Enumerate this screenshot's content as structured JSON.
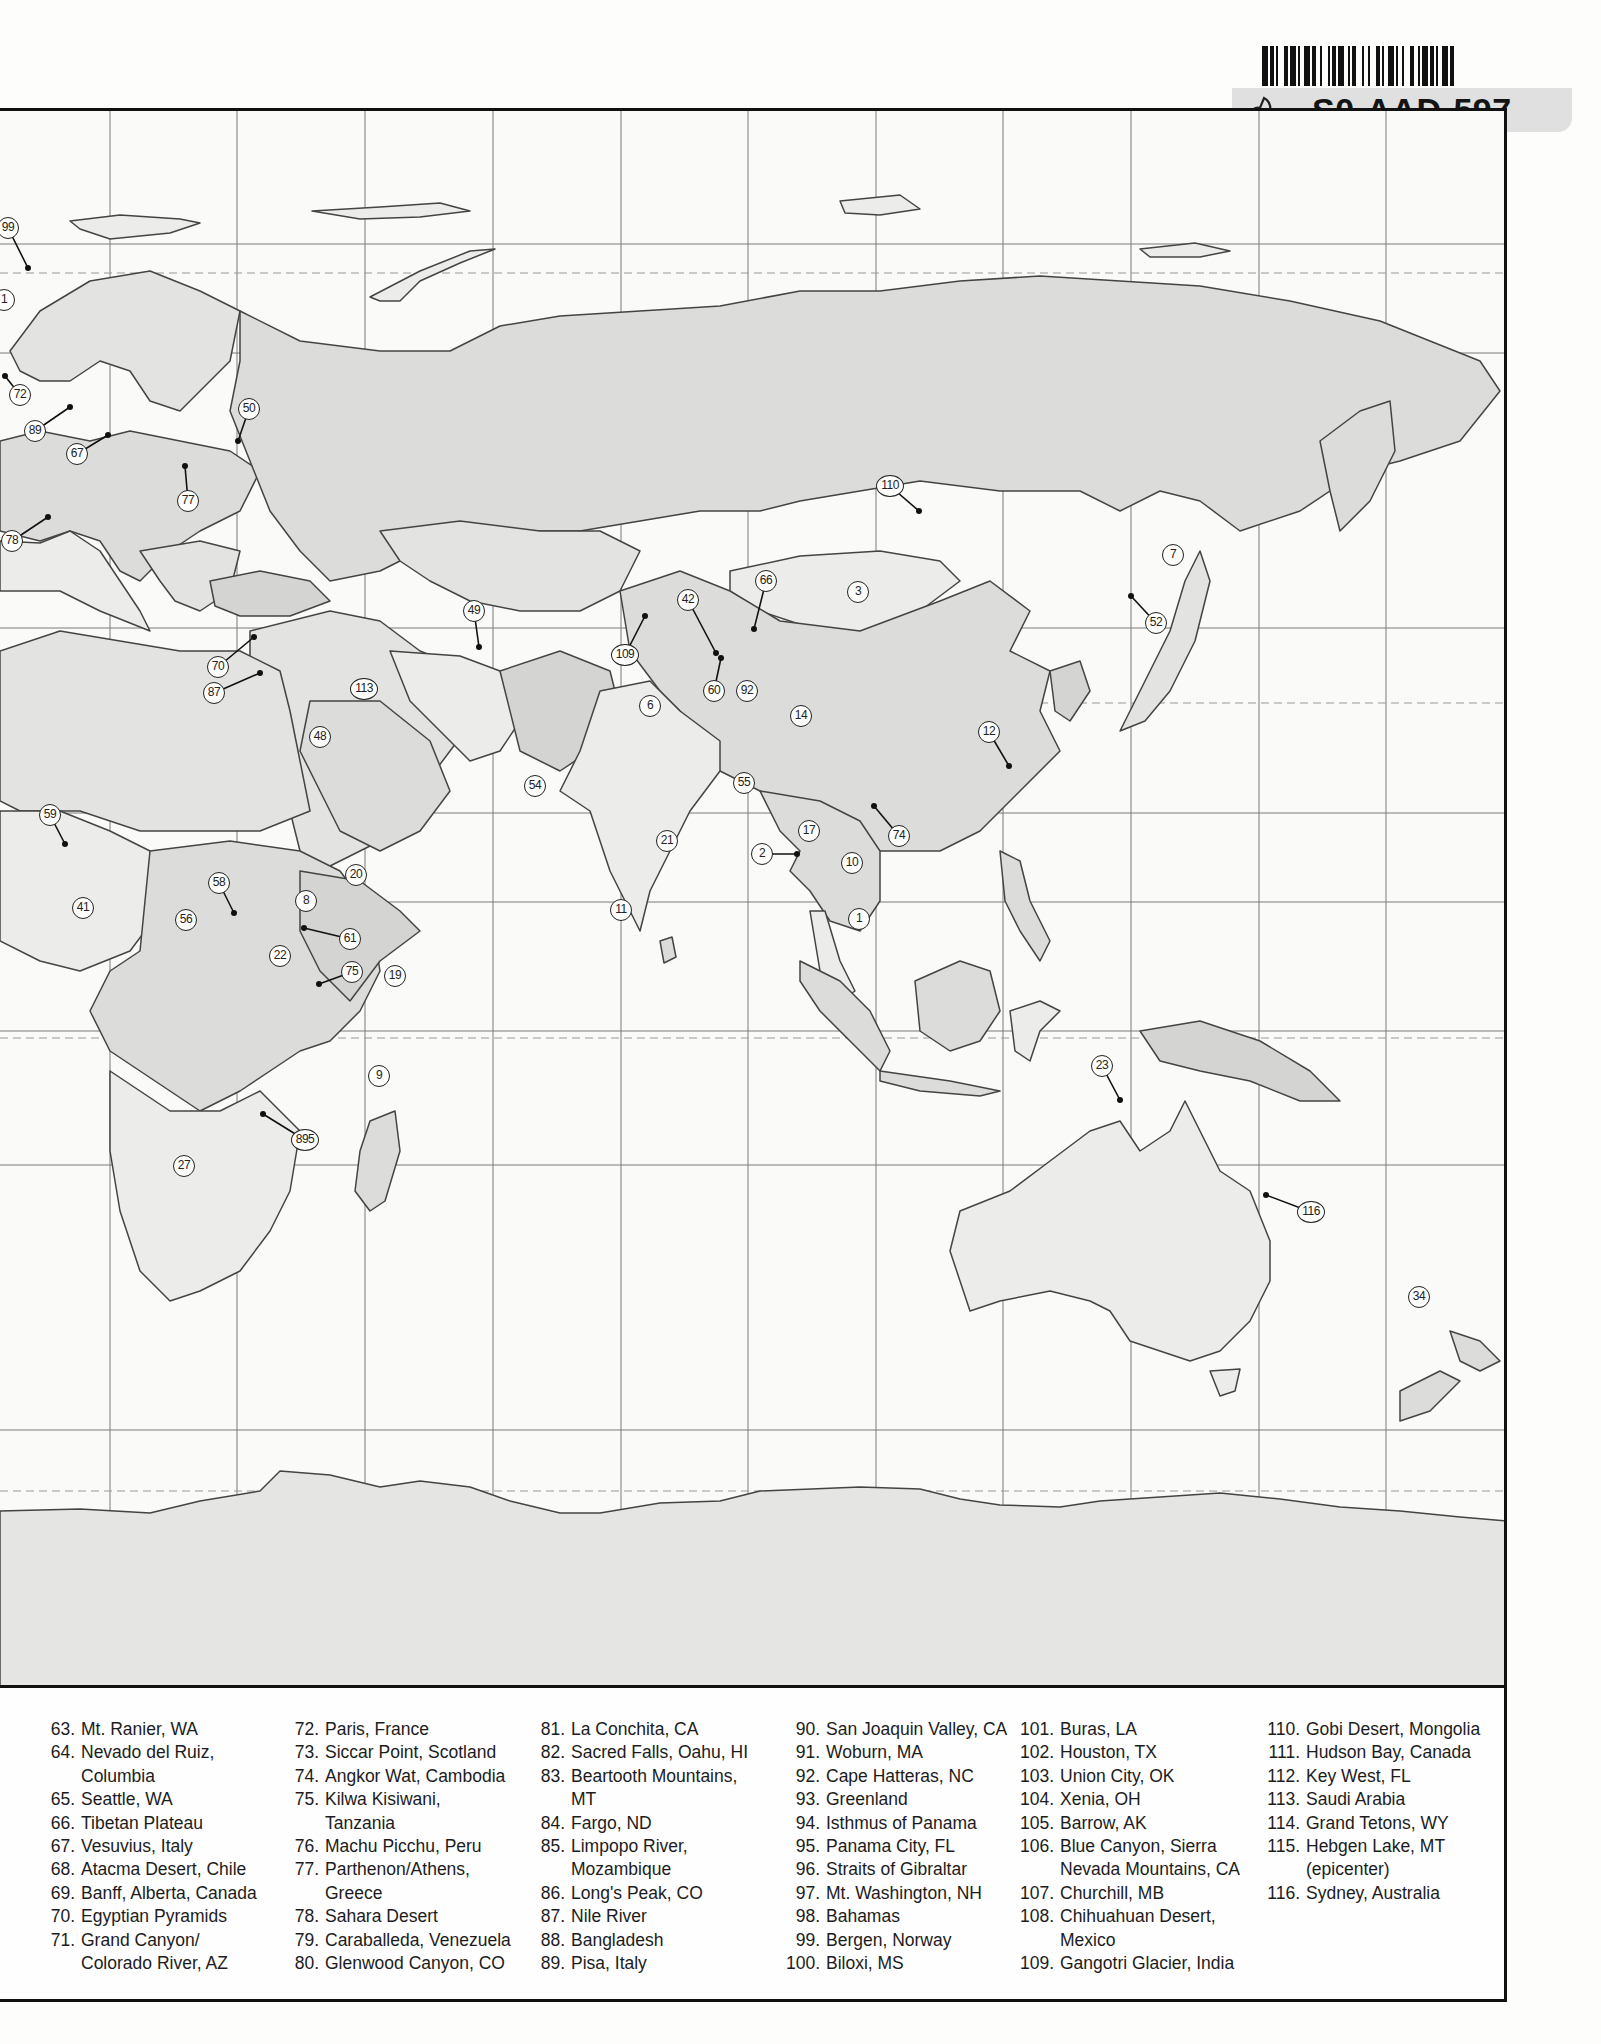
{
  "barcode_label": {
    "code": "S0-AAD-597"
  },
  "map": {
    "colors": {
      "ocean": "#fafaf8",
      "land_light": "#ececea",
      "land_mid": "#dcdcda",
      "land_dark": "#cfcfcd",
      "border": "#444444",
      "grid": "#7a7a7a"
    },
    "grid": {
      "vertical_x": [
        110,
        237,
        365,
        493,
        621,
        748,
        876,
        1003,
        1131,
        1259,
        1386
      ],
      "horizontal_y": [
        133,
        242,
        517,
        702,
        791,
        920,
        1054,
        1319
      ],
      "dashed_y": [
        162,
        592,
        927,
        1380
      ]
    },
    "markers": [
      {
        "id": "99",
        "x": 8,
        "y": 225,
        "dot": [
          28,
          265
        ]
      },
      {
        "id": "1",
        "x": 4,
        "y": 297
      },
      {
        "id": "72",
        "x": 20,
        "y": 392,
        "dot": [
          5,
          373
        ]
      },
      {
        "id": "89",
        "x": 35,
        "y": 428,
        "dot": [
          70,
          404
        ]
      },
      {
        "id": "67",
        "x": 77,
        "y": 451,
        "dot": [
          108,
          432
        ]
      },
      {
        "id": "50",
        "x": 249,
        "y": 406,
        "dot": [
          238,
          438
        ]
      },
      {
        "id": "77",
        "x": 188,
        "y": 498,
        "dot": [
          185,
          463
        ]
      },
      {
        "id": "78",
        "x": 12,
        "y": 538,
        "dot": [
          48,
          514
        ]
      },
      {
        "id": "70",
        "x": 218,
        "y": 664,
        "dot": [
          254,
          634
        ]
      },
      {
        "id": "87",
        "x": 214,
        "y": 690,
        "dot": [
          260,
          670
        ]
      },
      {
        "id": "113",
        "x": 364,
        "y": 686
      },
      {
        "id": "49",
        "x": 474,
        "y": 608,
        "dot": [
          479,
          644
        ]
      },
      {
        "id": "109",
        "x": 625,
        "y": 652,
        "dot": [
          645,
          613
        ]
      },
      {
        "id": "6",
        "x": 650,
        "y": 703
      },
      {
        "id": "48",
        "x": 320,
        "y": 734
      },
      {
        "id": "54",
        "x": 535,
        "y": 783
      },
      {
        "id": "42",
        "x": 688,
        "y": 597,
        "dot": [
          716,
          650
        ]
      },
      {
        "id": "66",
        "x": 766,
        "y": 578,
        "dot": [
          754,
          626
        ]
      },
      {
        "id": "60",
        "x": 714,
        "y": 688,
        "dot": [
          721,
          655
        ]
      },
      {
        "id": "92",
        "x": 747,
        "y": 688
      },
      {
        "id": "3",
        "x": 858,
        "y": 589
      },
      {
        "id": "110",
        "x": 890,
        "y": 483,
        "dot": [
          919,
          508
        ]
      },
      {
        "id": "14",
        "x": 801,
        "y": 713
      },
      {
        "id": "55",
        "x": 744,
        "y": 780
      },
      {
        "id": "12",
        "x": 989,
        "y": 729,
        "dot": [
          1009,
          763
        ]
      },
      {
        "id": "7",
        "x": 1173,
        "y": 552
      },
      {
        "id": "52",
        "x": 1156,
        "y": 620,
        "dot": [
          1131,
          593
        ]
      },
      {
        "id": "17",
        "x": 809,
        "y": 828
      },
      {
        "id": "74",
        "x": 899,
        "y": 833,
        "dot": [
          874,
          803
        ]
      },
      {
        "id": "2",
        "x": 762,
        "y": 851,
        "dot": [
          797,
          851
        ]
      },
      {
        "id": "10",
        "x": 852,
        "y": 860
      },
      {
        "id": "1b",
        "label": "1",
        "x": 859,
        "y": 916
      },
      {
        "id": "21",
        "x": 667,
        "y": 838
      },
      {
        "id": "11",
        "x": 621,
        "y": 907
      },
      {
        "id": "59",
        "x": 50,
        "y": 812,
        "dot": [
          65,
          841
        ]
      },
      {
        "id": "41",
        "x": 83,
        "y": 905
      },
      {
        "id": "58",
        "x": 219,
        "y": 880,
        "dot": [
          234,
          910
        ]
      },
      {
        "id": "56",
        "x": 186,
        "y": 917
      },
      {
        "id": "20",
        "x": 356,
        "y": 872
      },
      {
        "id": "8",
        "x": 306,
        "y": 898
      },
      {
        "id": "61",
        "x": 350,
        "y": 936,
        "dot": [
          304,
          925
        ]
      },
      {
        "id": "22",
        "x": 280,
        "y": 953
      },
      {
        "id": "75",
        "x": 352,
        "y": 969,
        "dot": [
          319,
          981
        ]
      },
      {
        "id": "19",
        "x": 395,
        "y": 973
      },
      {
        "id": "9",
        "x": 379,
        "y": 1073
      },
      {
        "id": "895",
        "x": 305,
        "y": 1137,
        "dot": [
          263,
          1111
        ]
      },
      {
        "id": "27",
        "x": 184,
        "y": 1163
      },
      {
        "id": "23",
        "x": 1102,
        "y": 1063,
        "dot": [
          1120,
          1097
        ]
      },
      {
        "id": "116",
        "x": 1311,
        "y": 1209,
        "dot": [
          1266,
          1192
        ]
      },
      {
        "id": "34",
        "x": 1419,
        "y": 1294
      }
    ]
  },
  "legend": {
    "columns": [
      [
        {
          "num": "63.",
          "text": "Mt. Ranier, WA"
        },
        {
          "num": "64.",
          "text": "Nevado del Ruiz,",
          "cont": "Columbia"
        },
        {
          "num": "65.",
          "text": "Seattle, WA"
        },
        {
          "num": "66.",
          "text": "Tibetan Plateau"
        },
        {
          "num": "67.",
          "text": "Vesuvius, Italy"
        },
        {
          "num": "68.",
          "text": "Atacma Desert, Chile"
        },
        {
          "num": "69.",
          "text": "Banff, Alberta, Canada"
        },
        {
          "num": "70.",
          "text": "Egyptian Pyramids"
        },
        {
          "num": "71.",
          "text": "Grand Canyon/",
          "cont": "Colorado River, AZ"
        }
      ],
      [
        {
          "num": "72.",
          "text": "Paris, France"
        },
        {
          "num": "73.",
          "text": "Siccar Point, Scotland"
        },
        {
          "num": "74.",
          "text": "Angkor Wat, Cambodia"
        },
        {
          "num": "75.",
          "text": "Kilwa Kisiwani,",
          "cont": "Tanzania"
        },
        {
          "num": "76.",
          "text": "Machu Picchu, Peru"
        },
        {
          "num": "77.",
          "text": "Parthenon/Athens,",
          "cont": "Greece"
        },
        {
          "num": "78.",
          "text": "Sahara Desert"
        },
        {
          "num": "79.",
          "text": "Caraballeda, Venezuela"
        },
        {
          "num": "80.",
          "text": "Glenwood Canyon, CO"
        }
      ],
      [
        {
          "num": "81.",
          "text": "La Conchita, CA"
        },
        {
          "num": "82.",
          "text": "Sacred Falls, Oahu, HI"
        },
        {
          "num": "83.",
          "text": "Beartooth Mountains,",
          "cont": "MT"
        },
        {
          "num": "84.",
          "text": "Fargo, ND"
        },
        {
          "num": "85.",
          "text": "Limpopo River,",
          "cont": "Mozambique"
        },
        {
          "num": "86.",
          "text": "Long's Peak, CO"
        },
        {
          "num": "87.",
          "text": "Nile River"
        },
        {
          "num": "88.",
          "text": "Bangladesh"
        },
        {
          "num": "89.",
          "text": "Pisa, Italy"
        }
      ],
      [
        {
          "num": "90.",
          "text": "San Joaquin Valley, CA"
        },
        {
          "num": "91.",
          "text": "Woburn, MA"
        },
        {
          "num": "92.",
          "text": "Cape Hatteras, NC"
        },
        {
          "num": "93.",
          "text": "Greenland"
        },
        {
          "num": "94.",
          "text": "Isthmus of Panama"
        },
        {
          "num": "95.",
          "text": "Panama City, FL"
        },
        {
          "num": "96.",
          "text": "Straits of Gibraltar"
        },
        {
          "num": "97.",
          "text": "Mt. Washington, NH"
        },
        {
          "num": "98.",
          "text": "Bahamas"
        },
        {
          "num": "99.",
          "text": "Bergen, Norway"
        },
        {
          "num": "100.",
          "text": "Biloxi, MS"
        }
      ],
      [
        {
          "num": "101.",
          "text": "Buras, LA"
        },
        {
          "num": "102.",
          "text": "Houston, TX"
        },
        {
          "num": "103.",
          "text": "Union City, OK"
        },
        {
          "num": "104.",
          "text": "Xenia, OH"
        },
        {
          "num": "105.",
          "text": "Barrow, AK"
        },
        {
          "num": "106.",
          "text": "Blue Canyon, Sierra",
          "cont": "Nevada Mountains, CA"
        },
        {
          "num": "107.",
          "text": "Churchill, MB"
        },
        {
          "num": "108.",
          "text": "Chihuahuan Desert,",
          "cont": "Mexico"
        },
        {
          "num": "109.",
          "text": "Gangotri Glacier, India"
        }
      ],
      [
        {
          "num": "110.",
          "text": "Gobi Desert, Mongolia"
        },
        {
          "num": "111.",
          "text": "Hudson Bay, Canada"
        },
        {
          "num": "112.",
          "text": "Key West, FL"
        },
        {
          "num": "113.",
          "text": "Saudi Arabia"
        },
        {
          "num": "114.",
          "text": "Grand Tetons, WY"
        },
        {
          "num": "115.",
          "text": "Hebgen Lake, MT",
          "cont": "(epicenter)"
        },
        {
          "num": "116.",
          "text": "Sydney, Australia"
        }
      ]
    ]
  }
}
